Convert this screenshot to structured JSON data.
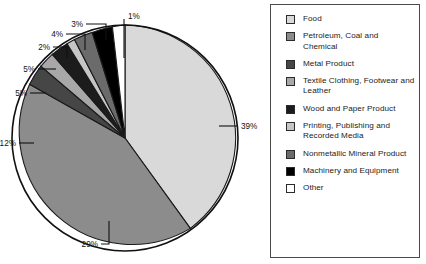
{
  "chart_data": {
    "type": "pie",
    "title": "",
    "subtitle": "",
    "xlabel": "",
    "ylabel": "",
    "legend_position": "right",
    "grid": false,
    "units": "percent",
    "categories": [
      "Food",
      "Petroleum, Coal and Chemical",
      "Metal Product",
      "Textile Clothing, Footwear and Leather",
      "Wood and Paper Product",
      "Printing, Publishing and Recorded Media",
      "Nonmetallic Mineral Product",
      "Machinery and Equipment",
      "Other"
    ],
    "values": [
      39,
      29,
      12,
      5,
      5,
      2,
      4,
      3,
      1
    ],
    "data_labels": [
      "39%",
      "29%",
      "12%",
      "5%",
      "5%",
      "2%",
      "4%",
      "3%",
      "1%"
    ],
    "colors": [
      "#d9d9d9",
      "#8c8c8c",
      "#464646",
      "#a8a8a8",
      "#1c1c1c",
      "#c6c6c6",
      "#6b6b6b",
      "#000000",
      "#ffffff"
    ],
    "slices": [
      {
        "label": "Food",
        "value": 39,
        "data_label": "39%",
        "color": "#d9d9d9",
        "label_side": "right"
      },
      {
        "label": "Petroleum, Coal and Chemical",
        "value": 29,
        "data_label": "29%",
        "color": "#8c8c8c",
        "label_side": "bottom"
      },
      {
        "label": "Metal Product",
        "value": 12,
        "data_label": "12%",
        "color": "#464646",
        "label_side": "left"
      },
      {
        "label": "Textile Clothing, Footwear and Leather",
        "value": 5,
        "data_label": "5%",
        "color": "#a8a8a8",
        "label_side": "left"
      },
      {
        "label": "Wood and Paper Product",
        "value": 5,
        "data_label": "5%",
        "color": "#1c1c1c",
        "label_side": "left"
      },
      {
        "label": "Printing, Publishing and Recorded Media",
        "value": 2,
        "data_label": "2%",
        "color": "#c6c6c6",
        "label_side": "left"
      },
      {
        "label": "Nonmetallic Mineral Product",
        "value": 4,
        "data_label": "4%",
        "color": "#6b6b6b",
        "label_side": "top"
      },
      {
        "label": "Machinery and Equipment",
        "value": 3,
        "data_label": "3%",
        "color": "#000000",
        "label_side": "top"
      },
      {
        "label": "Other",
        "value": 1,
        "data_label": "1%",
        "color": "#ffffff",
        "label_side": "top"
      }
    ]
  },
  "legend": {
    "items": [
      {
        "label": "Food",
        "color": "#d9d9d9"
      },
      {
        "label": "Petroleum, Coal and Chemical",
        "color": "#8c8c8c"
      },
      {
        "label": "Metal Product",
        "color": "#464646"
      },
      {
        "label": "Textile Clothing, Footwear and Leather",
        "color": "#a8a8a8"
      },
      {
        "label": "Wood and Paper Product",
        "color": "#1c1c1c"
      },
      {
        "label": "Printing, Publishing and Recorded Media",
        "color": "#c6c6c6"
      },
      {
        "label": "Nonmetallic Mineral Product",
        "color": "#6b6b6b"
      },
      {
        "label": "Machinery and Equipment",
        "color": "#000000"
      },
      {
        "label": "Other",
        "color": "#ffffff"
      }
    ]
  },
  "labels": {
    "pct_39": "39%",
    "pct_29": "29%",
    "pct_12": "12%",
    "pct_5a": "5%",
    "pct_5b": "5%",
    "pct_2": "2%",
    "pct_4": "4%",
    "pct_3": "3%",
    "pct_1": "1%"
  }
}
